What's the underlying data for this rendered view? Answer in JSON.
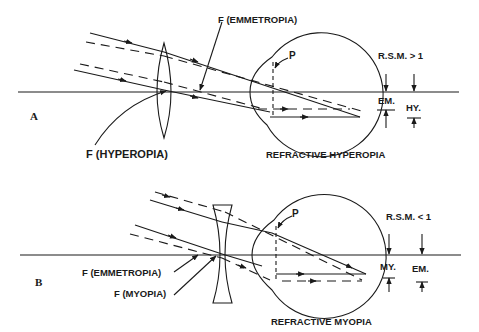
{
  "panel_a": {
    "letter": "A",
    "label_f_emmetropia": "F (EMMETROPIA)",
    "label_f_hyperopia": "F (HYPEROPIA)",
    "label_p": "P",
    "label_rsm": "R.S.M. > 1",
    "label_em": "EM.",
    "label_hy": "HY.",
    "caption": "REFRACTIVE HYPEROPIA",
    "lens_type": "convex"
  },
  "panel_b": {
    "letter": "B",
    "label_f_emmetropia": "F (EMMETROPIA)",
    "label_f_myopia": "F (MYOPIA)",
    "label_p": "P",
    "label_rsm": "R.S.M. < 1",
    "label_my": "MY.",
    "label_em": "EM.",
    "caption": "REFRACTIVE MYOPIA",
    "lens_type": "concave"
  }
}
